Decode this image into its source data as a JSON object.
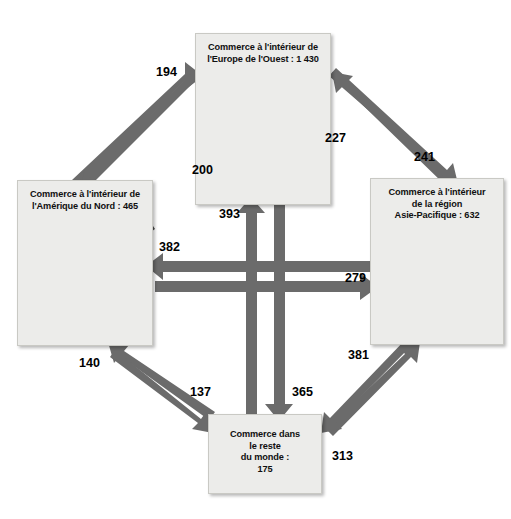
{
  "diagram": {
    "type": "flow-map-diagram",
    "nodes": [
      {
        "id": "europe",
        "label_lines": [
          "Commerce à l'intérieur de",
          "l'Europe de l'Ouest : 1 430"
        ],
        "internal_trade": 1430,
        "map": "western-europe-map"
      },
      {
        "id": "north_america",
        "label_lines": [
          "Commerce à l'intérieur de",
          "l'Amérique du Nord : 465"
        ],
        "internal_trade": 465,
        "map": "north-america-map"
      },
      {
        "id": "asia_pacific",
        "label_lines": [
          "Commerce à l'intérieur",
          "de la région",
          "Asie-Pacifique : 632"
        ],
        "internal_trade": 632,
        "map": "asia-pacific-map"
      },
      {
        "id": "rest_of_world",
        "label_lines": [
          "Commerce dans",
          "le reste",
          "du monde :",
          "175"
        ],
        "internal_trade": 175,
        "map": "none"
      }
    ],
    "flows": [
      {
        "id": "na-to-eu",
        "from": "north_america",
        "to": "europe",
        "value": "194"
      },
      {
        "id": "eu-to-na",
        "from": "europe",
        "to": "north_america",
        "value": "200"
      },
      {
        "id": "ap-to-eu",
        "from": "asia_pacific",
        "to": "europe",
        "value": "227"
      },
      {
        "id": "eu-to-ap",
        "from": "europe",
        "to": "asia_pacific",
        "value": "241"
      },
      {
        "id": "row-to-eu",
        "from": "rest_of_world",
        "to": "europe",
        "value": "393"
      },
      {
        "id": "ap-to-na",
        "from": "asia_pacific",
        "to": "north_america",
        "value": "382"
      },
      {
        "id": "na-to-ap",
        "from": "north_america",
        "to": "asia_pacific",
        "value": "279"
      },
      {
        "id": "row-to-na",
        "from": "rest_of_world",
        "to": "north_america",
        "value": "140"
      },
      {
        "id": "na-to-row",
        "from": "north_america",
        "to": "rest_of_world",
        "value": "137"
      },
      {
        "id": "eu-to-row",
        "from": "europe",
        "to": "rest_of_world",
        "value": "365"
      },
      {
        "id": "row-to-ap",
        "from": "rest_of_world",
        "to": "asia_pacific",
        "value": "381"
      },
      {
        "id": "ap-to-row",
        "from": "asia_pacific",
        "to": "rest_of_world",
        "value": "313"
      }
    ],
    "colors": {
      "arrow": "#6b6b6b",
      "box_fill": "#ececea",
      "map_fill": "#4a4a4a",
      "text": "#101010"
    }
  }
}
